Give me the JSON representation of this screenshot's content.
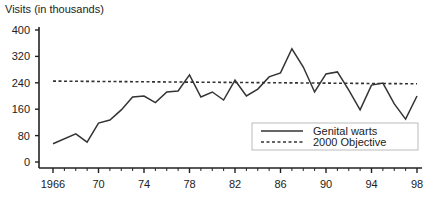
{
  "chart_data": {
    "type": "line",
    "title": "",
    "ylabel": "Visits (in thousands)",
    "xlabel": "",
    "ylim": [
      0,
      400
    ],
    "xlim": [
      1966,
      1998
    ],
    "yticks": [
      0,
      80,
      160,
      240,
      320,
      400
    ],
    "xticks": [
      1966,
      1970,
      1974,
      1978,
      1982,
      1986,
      1990,
      1994,
      1998
    ],
    "xtick_labels": [
      "1966",
      "70",
      "74",
      "78",
      "82",
      "86",
      "90",
      "94",
      "98"
    ],
    "grid": false,
    "legend_position": "lower right",
    "series": [
      {
        "name": "Genital warts",
        "style": "solid",
        "x": [
          1966,
          1968,
          1969,
          1970,
          1971,
          1972,
          1973,
          1974,
          1975,
          1976,
          1977,
          1978,
          1979,
          1980,
          1981,
          1982,
          1983,
          1984,
          1985,
          1986,
          1987,
          1988,
          1989,
          1990,
          1991,
          1992,
          1993,
          1994,
          1995,
          1996,
          1997,
          1998
        ],
        "values": [
          55,
          85,
          60,
          118,
          127,
          158,
          197,
          200,
          180,
          212,
          215,
          264,
          197,
          212,
          188,
          248,
          200,
          221,
          258,
          270,
          343,
          288,
          212,
          267,
          273,
          218,
          158,
          233,
          239,
          176,
          130,
          200
        ]
      },
      {
        "name": "2000 Objective",
        "style": "dotted",
        "x": [
          1966,
          1998
        ],
        "values": [
          245,
          237
        ]
      }
    ]
  },
  "legend": {
    "items": [
      {
        "label": "Genital warts",
        "style": "solid"
      },
      {
        "label": "2000 Objective",
        "style": "dotted"
      }
    ]
  },
  "colors": {
    "line": "#333333",
    "axis": "#222222",
    "legend_border": "#bbbbbb"
  }
}
